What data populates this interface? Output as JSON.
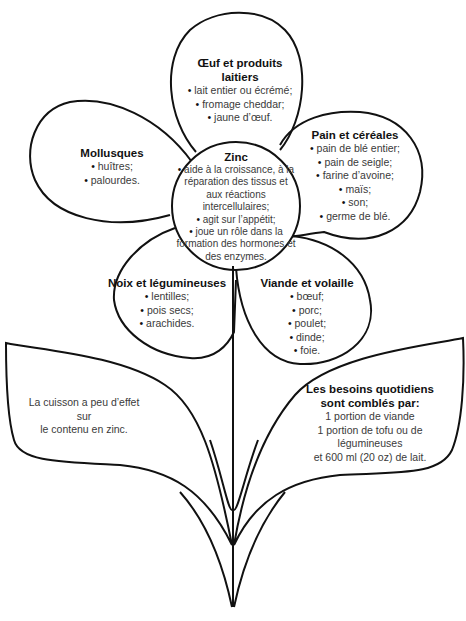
{
  "diagram": {
    "center": {
      "title": "Zinc",
      "items": [
        "aide à la croissance, à la réparation des tissus et aux réactions intercellulaires;",
        "agit sur l’appétit;",
        "joue un rôle dans la formation des hormones et des enzymes."
      ]
    },
    "petals": [
      {
        "id": "oeuf",
        "title_lines": [
          "Œuf et produits",
          "laitiers"
        ],
        "items": [
          "lait entier ou écrémé;",
          "fromage cheddar;",
          "jaune d’œuf."
        ]
      },
      {
        "id": "pain",
        "title_lines": [
          "Pain et céréales"
        ],
        "items": [
          "pain de blé entier;",
          "pain de seigle;",
          "farine d’avoine;",
          "maïs;",
          "son;",
          "germe de blé."
        ]
      },
      {
        "id": "mollusques",
        "title_lines": [
          "Mollusques"
        ],
        "items": [
          "huîtres;",
          "palourdes."
        ]
      },
      {
        "id": "noix",
        "title_lines": [
          "Noix et légumineuses"
        ],
        "items": [
          "lentilles;",
          "pois secs;",
          "arachides."
        ]
      },
      {
        "id": "viande",
        "title_lines": [
          "Viande et volaille"
        ],
        "items": [
          "bœuf;",
          "porc;",
          "poulet;",
          "dinde;",
          "foie."
        ]
      }
    ],
    "leaves": {
      "left": {
        "lines": [
          "La cuisson a peu d’effet",
          "sur",
          "le contenu en zinc."
        ]
      },
      "right": {
        "title_lines": [
          "Les besoins quotidiens",
          "sont comblés par:"
        ],
        "lines": [
          "1 portion de viande",
          "1 portion de tofu ou de",
          "légumineuses",
          "et 600 ml (20 oz) de lait."
        ]
      }
    },
    "stroke_color": "#111111",
    "background": "#ffffff"
  }
}
